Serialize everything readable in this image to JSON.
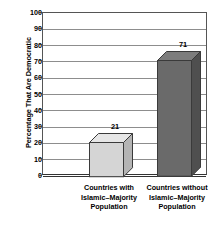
{
  "chart_data": {
    "type": "bar",
    "title": "",
    "subtitle": "",
    "xlabel": "",
    "ylabel": "Percentage That Are Democratic",
    "ylim": [
      0,
      100
    ],
    "ytick_step": 10,
    "yticks": [
      "100",
      "90",
      "80",
      "70",
      "60",
      "50",
      "40",
      "30",
      "20",
      "10",
      "0"
    ],
    "grid": true,
    "legend": "none",
    "style": "3d-bar",
    "categories": [
      "Countries with Islamic–Majority Population",
      "Countries without Islamic–Majority Population"
    ],
    "values": [
      21,
      71
    ],
    "value_labels": [
      "21",
      "71"
    ],
    "bar_colors": [
      "#d5d5d5",
      "#6a6a6a"
    ],
    "bar_top_colors": [
      "#e6e6e6",
      "#7d7d7d"
    ],
    "bar_side_colors": [
      "#b4b4b4",
      "#4f4f4f"
    ],
    "bar_edge_color": "#3a3a3a",
    "gridline_color": "#8d8d8d",
    "axis_color": "#333333",
    "background_color": "#ffffff"
  },
  "axis": {
    "y_title": "Percentage That Are Democratic"
  },
  "categories": [
    {
      "lines": [
        "Countries with",
        "Islamic–Majority",
        "Population"
      ]
    },
    {
      "lines": [
        "Countries without",
        "Islamic–Majority",
        "Population"
      ]
    }
  ]
}
